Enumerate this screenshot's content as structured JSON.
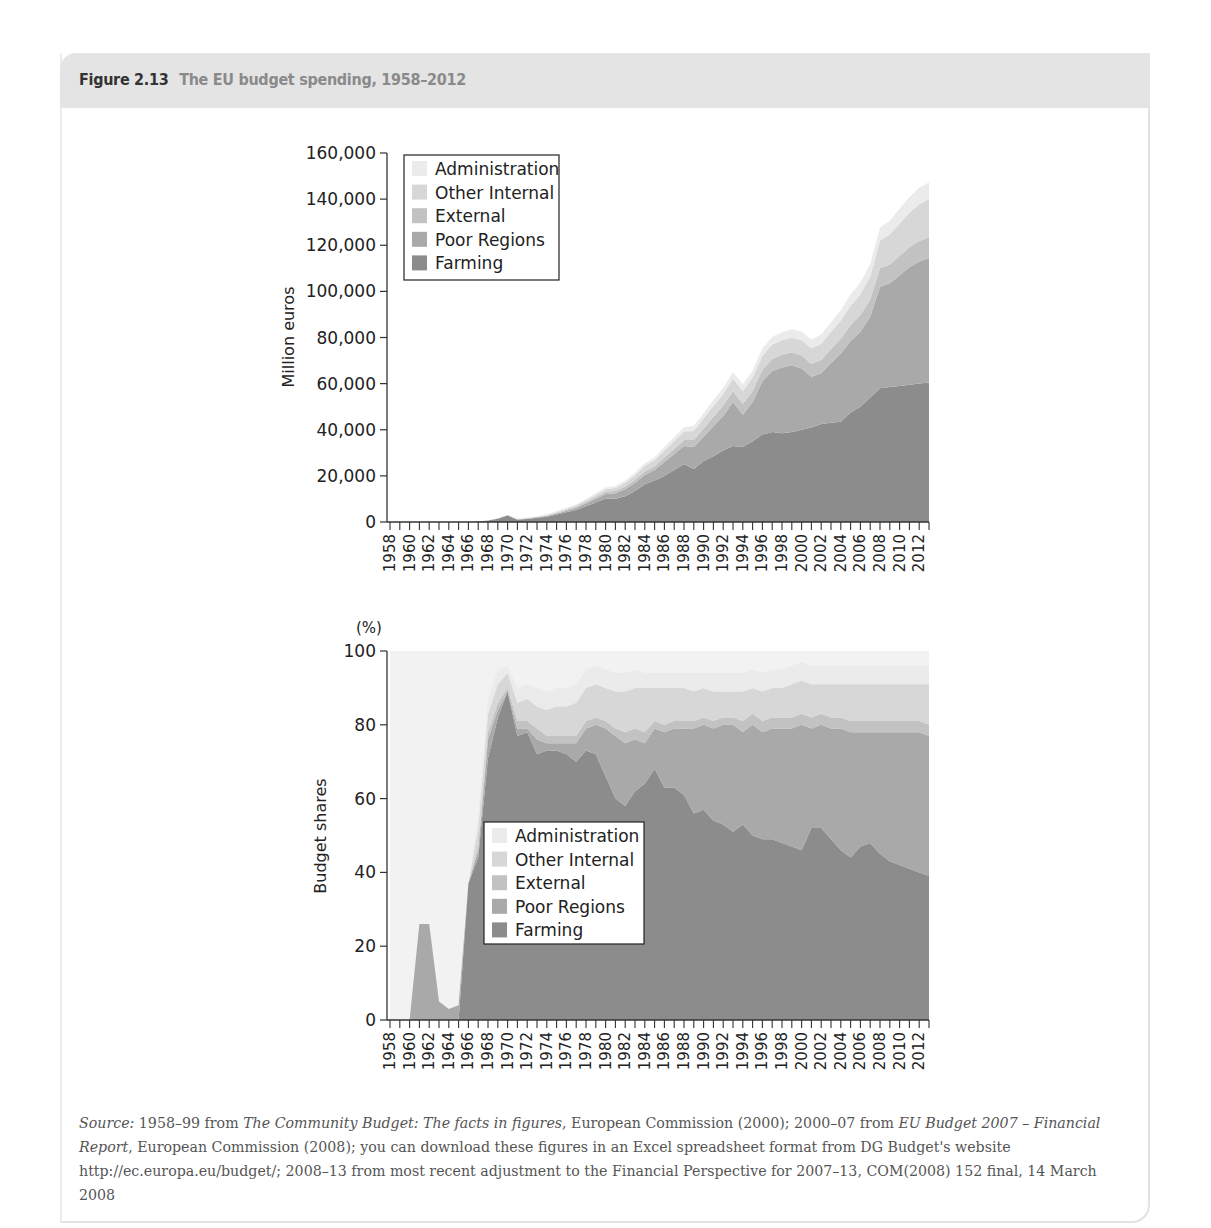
{
  "figure": {
    "number": "Figure 2.13",
    "caption": "The EU budget spending, 1958–2012"
  },
  "source": {
    "label": "Source:",
    "parts": [
      {
        "text": " 1958–99 from ",
        "italic": false
      },
      {
        "text": "The Community Budget: The facts in figures",
        "italic": true
      },
      {
        "text": ", European Commission (2000); 2000–07 from ",
        "italic": false
      },
      {
        "text": "EU Budget 2007 – Financial Report",
        "italic": true
      },
      {
        "text": ", European Commission (2008); you can download these figures in an Excel spreadsheet format from DG Budget's website http://ec.europa.eu/budget/; 2008–13 from most recent adjustment to the Financial Perspective for 2007–13, COM(2008) 152 final, 14 March 2008",
        "italic": false
      }
    ]
  },
  "colors": {
    "Farming": "#8c8c8c",
    "Poor Regions": "#a9a9a9",
    "External": "#c2c2c2",
    "Other Internal": "#d7d7d7",
    "Administration": "#ebebeb",
    "axis": "#333333",
    "plot_bg_bottom": "#f2f2f2"
  },
  "chart_data": [
    {
      "type": "area",
      "stacked": true,
      "title": "",
      "xlabel": "",
      "ylabel": "Million euros",
      "ylim": [
        0,
        160000
      ],
      "yticks": [
        0,
        20000,
        40000,
        60000,
        80000,
        100000,
        120000,
        140000,
        160000
      ],
      "ytick_labels": [
        "0",
        "20,000",
        "40,000",
        "60,000",
        "80,000",
        "100,000",
        "120,000",
        "140,000",
        "160,000"
      ],
      "x": [
        1958,
        1959,
        1960,
        1961,
        1962,
        1963,
        1964,
        1965,
        1966,
        1967,
        1968,
        1969,
        1970,
        1971,
        1972,
        1973,
        1974,
        1975,
        1976,
        1977,
        1978,
        1979,
        1980,
        1981,
        1982,
        1983,
        1984,
        1985,
        1986,
        1987,
        1988,
        1989,
        1990,
        1991,
        1992,
        1993,
        1994,
        1995,
        1996,
        1997,
        1998,
        1999,
        2000,
        2001,
        2002,
        2003,
        2004,
        2005,
        2006,
        2007,
        2008,
        2009,
        2010,
        2011,
        2012,
        2013
      ],
      "xtick_labels": [
        "1958",
        "1960",
        "1962",
        "1964",
        "1966",
        "1968",
        "1970",
        "1972",
        "1974",
        "1976",
        "1978",
        "1980",
        "1982",
        "1984",
        "1986",
        "1988",
        "1990",
        "1992",
        "1994",
        "1996",
        "1998",
        "2000",
        "2002",
        "2004",
        "2006",
        "2008",
        "2010",
        "2012"
      ],
      "legend": [
        "Administration",
        "Other Internal",
        "External",
        "Poor Regions",
        "Farming"
      ],
      "legend_position": "upper left",
      "grid": false,
      "series": [
        {
          "name": "Farming",
          "values": [
            0,
            0,
            0,
            0,
            0,
            0,
            0,
            0,
            50,
            200,
            600,
            1400,
            2800,
            1000,
            1300,
            1800,
            2300,
            3300,
            4200,
            5200,
            6800,
            8500,
            10200,
            10100,
            11200,
            13500,
            16400,
            18000,
            20000,
            22500,
            25000,
            23000,
            26500,
            28500,
            31000,
            33000,
            32500,
            35000,
            38000,
            39000,
            38500,
            39000,
            40000,
            41000,
            42500,
            43000,
            43500,
            47500,
            50000,
            54000,
            58000,
            58500,
            59000,
            59500,
            60000,
            60500
          ]
        },
        {
          "name": "Poor Regions",
          "values": [
            0,
            0,
            0,
            0,
            0,
            0,
            0,
            0,
            0,
            20,
            50,
            80,
            100,
            120,
            150,
            200,
            250,
            350,
            600,
            900,
            1200,
            1600,
            2000,
            2400,
            3000,
            3500,
            4000,
            4500,
            6000,
            7000,
            8000,
            9500,
            10500,
            13000,
            15000,
            19000,
            14000,
            17000,
            23000,
            26500,
            28500,
            29000,
            26500,
            22000,
            22000,
            26000,
            29500,
            31000,
            32500,
            35000,
            44000,
            45000,
            48000,
            51000,
            53000,
            54000
          ]
        },
        {
          "name": "External",
          "values": [
            0,
            0,
            0,
            0,
            0,
            0,
            0,
            0,
            0,
            0,
            20,
            50,
            80,
            100,
            150,
            200,
            300,
            400,
            500,
            600,
            700,
            800,
            900,
            1000,
            1200,
            1300,
            1500,
            1500,
            2000,
            2200,
            2500,
            3000,
            3500,
            4000,
            4500,
            4700,
            4700,
            4800,
            5000,
            5200,
            5500,
            5600,
            5700,
            5500,
            5800,
            6000,
            6500,
            6800,
            7200,
            7500,
            8000,
            8200,
            8400,
            8600,
            8800,
            9000
          ]
        },
        {
          "name": "Other Internal",
          "values": [
            0,
            0,
            0,
            0,
            0,
            0,
            0,
            0,
            0,
            0,
            30,
            60,
            100,
            120,
            150,
            200,
            250,
            350,
            450,
            550,
            700,
            900,
            1100,
            1300,
            1600,
            2000,
            2400,
            2800,
            3000,
            3400,
            3800,
            4000,
            4500,
            4800,
            5000,
            5500,
            5500,
            5800,
            6000,
            6200,
            6300,
            6400,
            6600,
            6800,
            7000,
            7400,
            7800,
            8500,
            9200,
            10000,
            12000,
            13000,
            14000,
            15000,
            16000,
            16500
          ]
        },
        {
          "name": "Administration",
          "values": [
            0,
            0,
            0,
            0,
            0,
            0,
            0,
            0,
            10,
            20,
            40,
            60,
            100,
            120,
            160,
            200,
            280,
            350,
            400,
            450,
            550,
            650,
            750,
            850,
            950,
            1050,
            1150,
            1250,
            1500,
            1700,
            1900,
            2100,
            2300,
            2500,
            2700,
            2900,
            3000,
            3100,
            3300,
            3400,
            3500,
            3600,
            3700,
            3800,
            4000,
            4200,
            4500,
            4800,
            5000,
            5300,
            5600,
            6000,
            6400,
            6800,
            7100,
            7300
          ]
        }
      ]
    },
    {
      "type": "area",
      "stacked": true,
      "title": "",
      "xlabel": "",
      "ylabel": "Budget shares",
      "yunit_label": "(%)",
      "ylim": [
        0,
        100
      ],
      "yticks": [
        0,
        20,
        40,
        60,
        80,
        100
      ],
      "ytick_labels": [
        "0",
        "20",
        "40",
        "60",
        "80",
        "100"
      ],
      "x": [
        1958,
        1959,
        1960,
        1961,
        1962,
        1963,
        1964,
        1965,
        1966,
        1967,
        1968,
        1969,
        1970,
        1971,
        1972,
        1973,
        1974,
        1975,
        1976,
        1977,
        1978,
        1979,
        1980,
        1981,
        1982,
        1983,
        1984,
        1985,
        1986,
        1987,
        1988,
        1989,
        1990,
        1991,
        1992,
        1993,
        1994,
        1995,
        1996,
        1997,
        1998,
        1999,
        2000,
        2001,
        2002,
        2003,
        2004,
        2005,
        2006,
        2007,
        2008,
        2009,
        2010,
        2011,
        2012,
        2013
      ],
      "xtick_labels": [
        "1958",
        "1960",
        "1962",
        "1964",
        "1966",
        "1968",
        "1970",
        "1972",
        "1974",
        "1976",
        "1978",
        "1980",
        "1982",
        "1984",
        "1986",
        "1988",
        "1990",
        "1992",
        "1994",
        "1996",
        "1998",
        "2000",
        "2002",
        "2004",
        "2006",
        "2008",
        "2010",
        "2012"
      ],
      "legend": [
        "Administration",
        "Other Internal",
        "External",
        "Poor Regions",
        "Farming"
      ],
      "legend_position": "center",
      "grid": false,
      "series": [
        {
          "name": "Farming",
          "values": [
            0,
            0,
            0,
            0,
            0,
            0,
            0,
            0,
            37,
            44,
            71,
            82,
            89,
            77,
            78,
            72,
            73,
            73,
            72,
            70,
            73,
            72,
            66,
            60,
            58,
            62,
            64,
            68,
            63,
            63,
            61,
            56,
            57,
            54,
            53,
            51,
            53,
            50,
            49,
            49,
            48,
            47,
            46,
            52,
            52,
            49,
            46,
            44,
            47,
            48,
            45,
            43,
            42,
            41,
            40,
            39
          ]
        },
        {
          "name": "Poor Regions",
          "values": [
            0,
            0,
            0,
            26,
            26,
            5,
            3,
            4,
            0,
            2,
            5,
            2,
            0,
            2,
            1,
            4,
            2,
            2,
            3,
            5,
            6,
            8,
            13,
            17,
            17,
            14,
            11,
            11,
            15,
            16,
            18,
            23,
            23,
            25,
            27,
            29,
            25,
            30,
            29,
            30,
            31,
            32,
            34,
            27,
            28,
            30,
            33,
            34,
            31,
            30,
            33,
            35,
            36,
            37,
            38,
            38
          ]
        },
        {
          "name": "External",
          "values": [
            0,
            0,
            0,
            0,
            0,
            0,
            0,
            0,
            0,
            1,
            2,
            2,
            1,
            2,
            2,
            3,
            2,
            2,
            2,
            2,
            2,
            2,
            2,
            2,
            3,
            3,
            3,
            2,
            2,
            2,
            2,
            2,
            2,
            2,
            2,
            2,
            3,
            3,
            3,
            3,
            3,
            3,
            3,
            3,
            3,
            3,
            3,
            3,
            3,
            3,
            3,
            3,
            3,
            3,
            3,
            3
          ]
        },
        {
          "name": "Other Internal",
          "values": [
            0,
            0,
            0,
            0,
            0,
            0,
            0,
            0,
            0,
            5,
            5,
            5,
            4,
            5,
            6,
            6,
            7,
            8,
            8,
            9,
            9,
            9,
            9,
            10,
            11,
            11,
            12,
            9,
            10,
            9,
            9,
            8,
            8,
            8,
            7,
            7,
            8,
            7,
            8,
            8,
            8,
            9,
            9,
            9,
            8,
            9,
            9,
            10,
            10,
            10,
            10,
            10,
            10,
            10,
            10,
            11
          ]
        },
        {
          "name": "Administration",
          "values": [
            0,
            0,
            0,
            0,
            0,
            0,
            0,
            0,
            0,
            3,
            4,
            4,
            2,
            4,
            4,
            5,
            5,
            5,
            5,
            5,
            5,
            5,
            5,
            5,
            5,
            5,
            4,
            4,
            4,
            4,
            4,
            5,
            4,
            5,
            5,
            5,
            5,
            5,
            5,
            5,
            5,
            5,
            5,
            5,
            5,
            5,
            5,
            5,
            5,
            5,
            5,
            5,
            5,
            5,
            5,
            5
          ]
        }
      ]
    }
  ]
}
